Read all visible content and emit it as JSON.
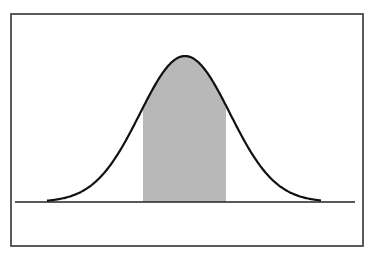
{
  "figure": {
    "frame": {
      "left": 11,
      "top": 14,
      "right": 363,
      "bottom": 246,
      "color": "#333333"
    },
    "baseline": {
      "y": 202,
      "x_start": 15,
      "x_end": 355,
      "color": "#222222"
    },
    "curve": {
      "peak_x": 185,
      "peak_y": 56,
      "left_tail_x": 47,
      "right_tail_x": 321,
      "sigma_px": 45,
      "color": "#111111"
    },
    "shaded_region": {
      "x_start": 143,
      "x_end": 226,
      "fill": "#b8b8b8"
    }
  },
  "chart_data": {
    "type": "area",
    "title": "",
    "xlabel": "",
    "ylabel": "",
    "distribution": "normal",
    "shaded_interval_sigma": [
      -0.93,
      0.91
    ],
    "grid": false,
    "legend": null
  }
}
